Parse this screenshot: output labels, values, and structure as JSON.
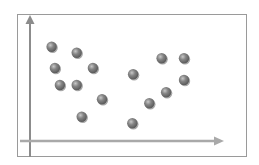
{
  "chart_data": {
    "type": "scatter",
    "title": "",
    "xlabel": "",
    "ylabel": "",
    "xlim": [
      0,
      100
    ],
    "ylim": [
      0,
      100
    ],
    "grid": false,
    "legend": null,
    "axis_style": "arrows, no ticks, no tick labels",
    "series": [
      {
        "name": "points",
        "color": "#7a7a7a",
        "points": [
          {
            "x": 11.2,
            "y": 75.4
          },
          {
            "x": 24.2,
            "y": 70.6
          },
          {
            "x": 12.9,
            "y": 58.4
          },
          {
            "x": 32.6,
            "y": 58.4
          },
          {
            "x": 15.5,
            "y": 44.8
          },
          {
            "x": 24.2,
            "y": 44.8
          },
          {
            "x": 37.3,
            "y": 33.4
          },
          {
            "x": 26.8,
            "y": 19.4
          },
          {
            "x": 53.4,
            "y": 53.4
          },
          {
            "x": 68.2,
            "y": 66.2
          },
          {
            "x": 79.8,
            "y": 66.2
          },
          {
            "x": 79.8,
            "y": 48.8
          },
          {
            "x": 70.5,
            "y": 39.0
          },
          {
            "x": 61.8,
            "y": 30.2
          },
          {
            "x": 53.0,
            "y": 14.2
          }
        ]
      }
    ]
  },
  "style": {
    "frame_color": "#9a9a9a",
    "axis_color": "#8c8c8c",
    "x_axis_color": "#a9a9a9",
    "dot_fill": "#7a7a7a",
    "dot_highlight": "#c4c4c4",
    "dot_shadow": "#555555"
  }
}
